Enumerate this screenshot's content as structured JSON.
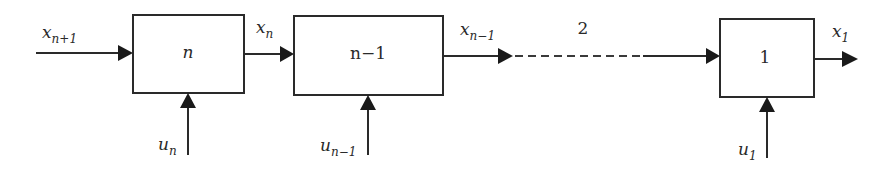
{
  "diagram": {
    "type": "serial-stage-block-diagram",
    "stages": [
      {
        "label": "n",
        "input_state": {
          "base": "x",
          "sub": "n+1"
        },
        "output_state": {
          "base": "x",
          "sub": "n"
        },
        "control": {
          "base": "u",
          "sub": "n"
        }
      },
      {
        "label": "n−1",
        "input_state": {
          "base": "x",
          "sub": "n"
        },
        "output_state": {
          "base": "x",
          "sub": "n−1"
        },
        "control": {
          "base": "u",
          "sub": "n−1"
        }
      },
      {
        "label": "1",
        "input_state": {
          "base": "x",
          "sub": "2"
        },
        "output_state": {
          "base": "x",
          "sub": "1"
        },
        "control": {
          "base": "u",
          "sub": "1"
        }
      }
    ],
    "gap_label": "2",
    "colors": {
      "stroke": "#2a2a2a",
      "background": "#ffffff"
    }
  }
}
